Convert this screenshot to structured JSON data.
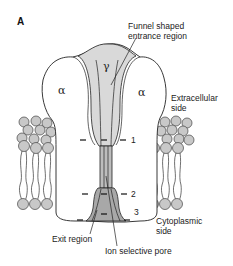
{
  "figure": {
    "panel_label": "A",
    "subunits": {
      "gamma": "γ",
      "alpha_left": "α",
      "alpha_right": "α"
    },
    "labels": {
      "funnel_line1": "Funnel shaped",
      "funnel_line2": "entrance region",
      "extracellular_line1": "Extracellular",
      "extracellular_line2": "side",
      "cytoplasmic_line1": "Cytoplasmic",
      "cytoplasmic_line2": "side",
      "exit_region": "Exit region",
      "ion_pore": "Ion selective pore"
    },
    "ring_markers": [
      "1",
      "2",
      "3"
    ],
    "colors": {
      "protein_fill": "#ffffff",
      "vestibule_fill": "#d9d9d9",
      "pore_fill": "#bdbdbd",
      "lipid_head": "#c8c8c8",
      "outline": "#222222"
    }
  }
}
